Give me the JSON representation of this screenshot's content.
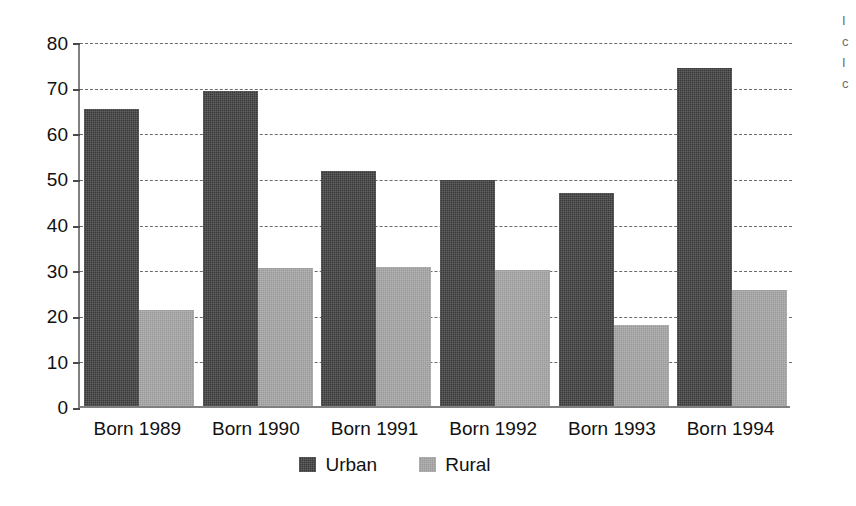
{
  "chart_data": {
    "type": "bar",
    "title": "",
    "subtitle": "",
    "xlabel": "",
    "ylabel": "",
    "categories": [
      "Born 1989",
      "Born 1990",
      "Born 1991",
      "Born 1992",
      "Born 1993",
      "Born 1994"
    ],
    "series": [
      {
        "name": "Urban",
        "color": "#3a3a3a",
        "values": [
          65.0,
          69.0,
          51.5,
          49.5,
          46.7,
          74.0
        ]
      },
      {
        "name": "Rural",
        "color": "#9a9a9a",
        "values": [
          21.0,
          30.3,
          30.5,
          29.8,
          17.8,
          25.5
        ]
      }
    ],
    "ylim": [
      0,
      80
    ],
    "ytick_values": [
      0,
      10,
      20,
      30,
      40,
      50,
      60,
      70,
      80
    ],
    "ytick_labels": [
      "0",
      "10",
      "20",
      "30",
      "40",
      "50",
      "60",
      "70",
      "80"
    ],
    "grid": "horizontal-dashed",
    "legend_position": "bottom-center",
    "legend_entries": [
      "Urban",
      "Rural"
    ]
  },
  "legend": {
    "entries": [
      {
        "label": "Urban",
        "swatch": "dark-swatch-icon"
      },
      {
        "label": "Rural",
        "swatch": "light-swatch-icon"
      }
    ]
  },
  "margin_text": {
    "lines": [
      "I",
      "c",
      "I",
      "c"
    ]
  }
}
